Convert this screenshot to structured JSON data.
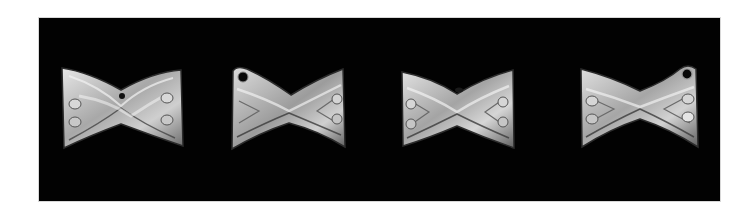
{
  "image": {
    "description": "Four bow-tie (hourglass) shaped metallic artifacts photographed side by side on a black background",
    "background_color": "#020202",
    "page_color": "#ffffff",
    "artifacts": [
      {
        "label": "artifact-1",
        "x": 59,
        "y": 66,
        "w": 125,
        "h": 84,
        "hole": false,
        "hole_side": "none"
      },
      {
        "label": "artifact-2",
        "x": 229,
        "y": 65,
        "w": 118,
        "h": 86,
        "hole": true,
        "hole_side": "left"
      },
      {
        "label": "artifact-3",
        "x": 399,
        "y": 68,
        "w": 116,
        "h": 82,
        "hole": false,
        "hole_side": "none"
      },
      {
        "label": "artifact-4",
        "x": 578,
        "y": 63,
        "w": 123,
        "h": 87,
        "hole": true,
        "hole_side": "right"
      }
    ],
    "metal_colors": {
      "highlight": "#e6e6e6",
      "mid": "#a8a8a8",
      "shadow": "#5a5a5a",
      "edge": "#2c2c2c"
    }
  }
}
